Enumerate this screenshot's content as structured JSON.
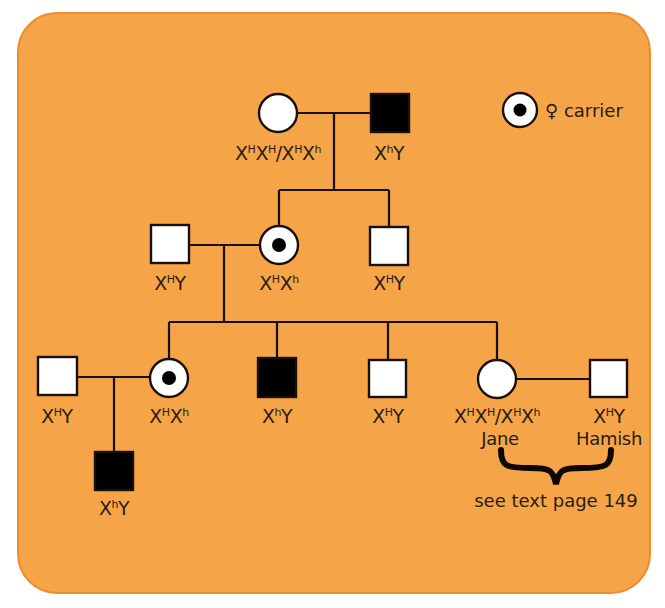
{
  "legend": {
    "symbol": "female-carrier",
    "glyph": "♀",
    "label": "carrier"
  },
  "generations": [
    {
      "id": 1,
      "individuals": [
        {
          "id": "g1-mother",
          "sex": "female",
          "status": "unaffected",
          "genotype_label": "X^H X^H / X^H X^h",
          "label_parts": [
            "X",
            "H",
            "X",
            "H",
            "/X",
            "H",
            "X",
            "h"
          ]
        },
        {
          "id": "g1-father",
          "sex": "male",
          "status": "affected",
          "genotype_label": "X^h Y",
          "label_parts": [
            "X",
            "h",
            "Y"
          ]
        }
      ]
    },
    {
      "id": 2,
      "individuals": [
        {
          "id": "g2-husband",
          "sex": "male",
          "status": "unaffected",
          "genotype_label": "X^H Y"
        },
        {
          "id": "g2-daughter",
          "sex": "female",
          "status": "carrier",
          "genotype_label": "X^H X^h"
        },
        {
          "id": "g2-son",
          "sex": "male",
          "status": "unaffected",
          "genotype_label": "X^H Y"
        }
      ]
    },
    {
      "id": 3,
      "individuals": [
        {
          "id": "g3-husband",
          "sex": "male",
          "status": "unaffected",
          "genotype_label": "X^H Y"
        },
        {
          "id": "g3-daughter1",
          "sex": "female",
          "status": "carrier",
          "genotype_label": "X^H X^h"
        },
        {
          "id": "g3-son1",
          "sex": "male",
          "status": "affected",
          "genotype_label": "X^h Y"
        },
        {
          "id": "g3-son2",
          "sex": "male",
          "status": "unaffected",
          "genotype_label": "X^H Y"
        },
        {
          "id": "g3-jane",
          "sex": "female",
          "status": "unaffected",
          "genotype_label": "X^H X^H / X^H X^h",
          "name": "Jane"
        },
        {
          "id": "g3-hamish",
          "sex": "male",
          "status": "unaffected",
          "genotype_label": "X^H Y",
          "name": "Hamish"
        }
      ]
    },
    {
      "id": 4,
      "individuals": [
        {
          "id": "g4-son",
          "sex": "male",
          "status": "affected",
          "genotype_label": "X^h Y"
        }
      ]
    }
  ],
  "names": {
    "jane": "Jane",
    "hamish": "Hamish"
  },
  "note": "see text page 149",
  "colors": {
    "background": "#F5A547",
    "border": "#EE8B2C",
    "ink": "#2a1c12",
    "affected": "#000000",
    "unaffected": "#ffffff"
  }
}
